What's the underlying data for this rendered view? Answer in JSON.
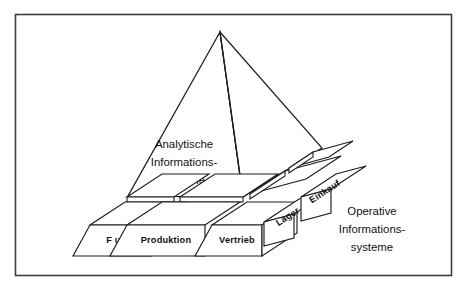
{
  "figure": {
    "background_color": "#ffffff",
    "line_color": "#1c1c1c",
    "frame_color": "#3c3c3c"
  },
  "pyramid": {
    "caption_lines": [
      "Analytische",
      "Informations-",
      "systeme"
    ]
  },
  "operative": {
    "caption_lines": [
      "Operative",
      "Informations-",
      "systeme"
    ]
  },
  "blocks": {
    "front_row": [
      {
        "label": "F u E"
      },
      {
        "label": "Produktion"
      },
      {
        "label": "Vertrieb"
      }
    ],
    "depth_row": [
      {
        "label": "Lager"
      },
      {
        "label": "Einkauf"
      }
    ]
  }
}
